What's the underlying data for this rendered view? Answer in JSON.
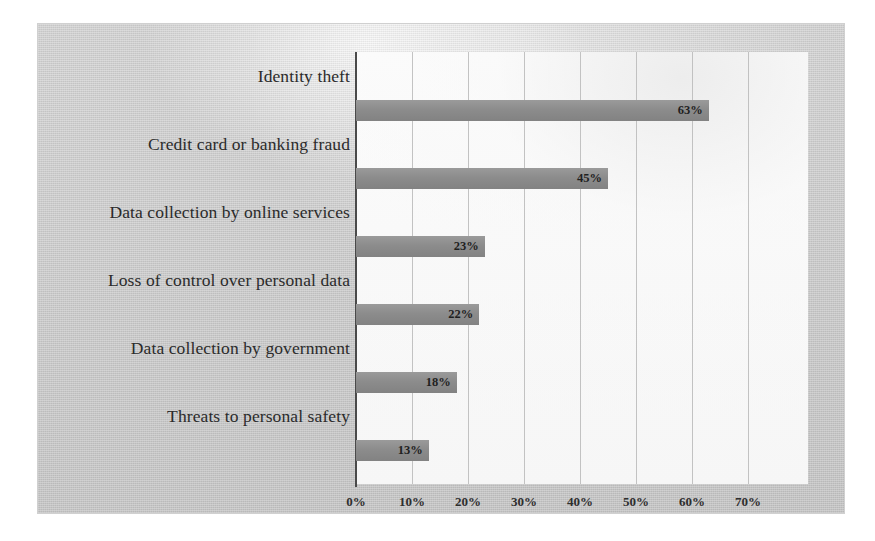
{
  "chart_data": {
    "type": "bar",
    "orientation": "horizontal",
    "title": "",
    "xlabel": "",
    "ylabel": "",
    "xlim": [
      0,
      70
    ],
    "grid": true,
    "legend": false,
    "value_label_suffix": "%",
    "categories": [
      "Identity theft",
      "Credit card or banking fraud",
      "Data collection by online services",
      "Loss of control over personal data",
      "Data collection by government",
      "Threats to personal safety"
    ],
    "values": [
      63,
      45,
      23,
      22,
      18,
      13
    ],
    "value_labels": [
      "63%",
      "45%",
      "23%",
      "22%",
      "18%",
      "13%"
    ],
    "xticks": [
      0,
      10,
      20,
      30,
      40,
      50,
      60,
      70
    ],
    "xtick_labels": [
      "0%",
      "10%",
      "20%",
      "30%",
      "40%",
      "50%",
      "60%",
      "70%"
    ],
    "colors": {
      "bar": "#8c8c8c",
      "axis": "#4a4a4a",
      "gridline": "#b9b9b9",
      "plot_background": "#f8f8f8",
      "page_background": "#c9c9c9",
      "text": "#2b2b2b"
    }
  }
}
